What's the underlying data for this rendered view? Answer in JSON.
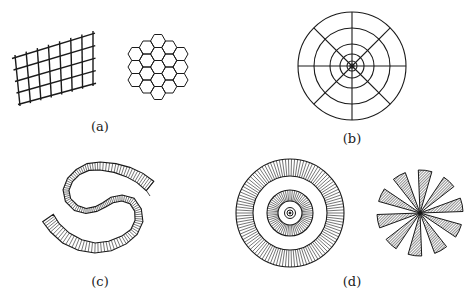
{
  "figure": {
    "panels": [
      {
        "id": "a",
        "label": "(a)",
        "description": "Sheared rectangular grid and hexagonal lattice",
        "position": {
          "x": 100,
          "y": 119
        }
      },
      {
        "id": "b",
        "label": "(b)",
        "description": "Polar grid: concentric circles with 8 radial lines",
        "position": {
          "x": 352,
          "y": 131
        }
      },
      {
        "id": "c",
        "label": "(c)",
        "description": "S-shaped hatched band",
        "position": {
          "x": 100,
          "y": 274
        }
      },
      {
        "id": "d",
        "label": "(d)",
        "description": "Concentric radially hatched rings and 10-blade hatched pinwheel",
        "position": {
          "x": 352,
          "y": 274
        }
      }
    ],
    "colors": {
      "ink": "#1a1a1a",
      "background": "#ffffff",
      "hatch_fill": "#9a9a9a"
    }
  }
}
